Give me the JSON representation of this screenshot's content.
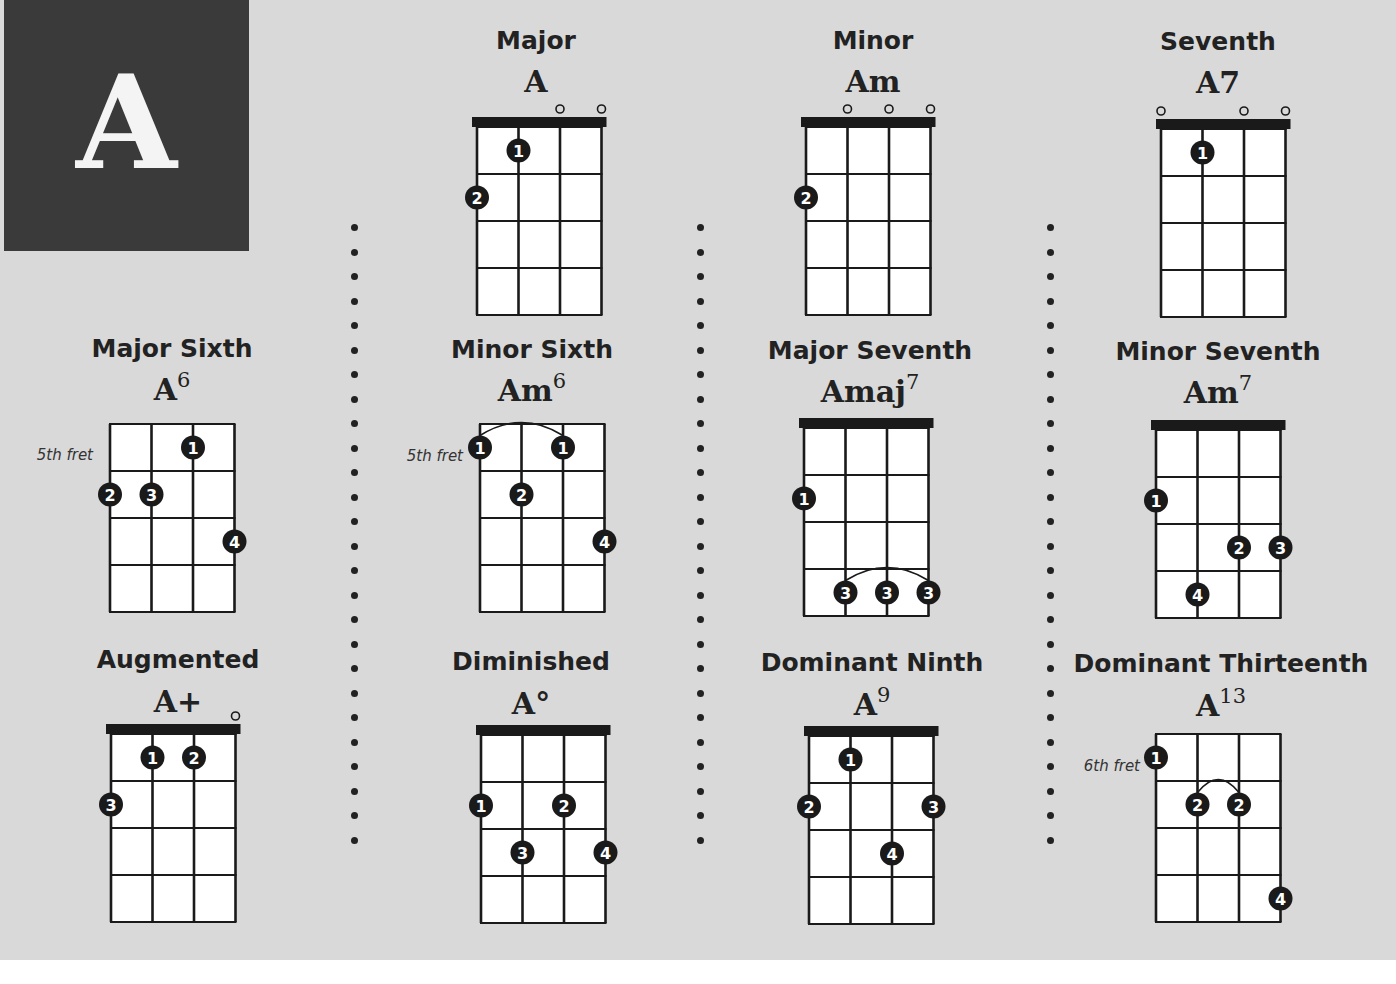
{
  "page": {
    "key_letter": "A",
    "colors": {
      "background": "#d9d9d9",
      "letter_box": "#3a3a3a",
      "ink": "#1a1a1a",
      "grid_fill": "#ffffff"
    }
  },
  "chords": [
    {
      "id": "major",
      "title": "Major",
      "symbol": "A",
      "sup": "",
      "fret_label": "",
      "nut": true,
      "open": [
        2,
        3
      ],
      "fingers": [
        {
          "string": 1,
          "fret": 1,
          "finger": "1"
        },
        {
          "string": 0,
          "fret": 2,
          "finger": "2"
        }
      ],
      "barre": null
    },
    {
      "id": "minor",
      "title": "Minor",
      "symbol": "Am",
      "sup": "",
      "fret_label": "",
      "nut": true,
      "open": [
        1,
        2,
        3
      ],
      "fingers": [
        {
          "string": 0,
          "fret": 2,
          "finger": "2"
        }
      ],
      "barre": null
    },
    {
      "id": "seventh",
      "title": "Seventh",
      "symbol": "A7",
      "sup": "",
      "fret_label": "",
      "nut": true,
      "open": [
        0,
        2,
        3
      ],
      "fingers": [
        {
          "string": 1,
          "fret": 1,
          "finger": "1"
        }
      ],
      "barre": null
    },
    {
      "id": "major-sixth",
      "title": "Major Sixth",
      "symbol": "A",
      "sup": "6",
      "fret_label": "5th fret",
      "nut": false,
      "open": [],
      "fingers": [
        {
          "string": 2,
          "fret": 1,
          "finger": "1"
        },
        {
          "string": 0,
          "fret": 2,
          "finger": "2"
        },
        {
          "string": 1,
          "fret": 2,
          "finger": "3"
        },
        {
          "string": 3,
          "fret": 3,
          "finger": "4"
        }
      ],
      "barre": null
    },
    {
      "id": "minor-sixth",
      "title": "Minor Sixth",
      "symbol": "Am",
      "sup": "6",
      "fret_label": "5th fret",
      "nut": false,
      "open": [],
      "fingers": [
        {
          "string": 0,
          "fret": 1,
          "finger": "1"
        },
        {
          "string": 2,
          "fret": 1,
          "finger": "1"
        },
        {
          "string": 1,
          "fret": 2,
          "finger": "2"
        },
        {
          "string": 3,
          "fret": 3,
          "finger": "4"
        }
      ],
      "barre": {
        "fret": 1,
        "from": 0,
        "to": 2
      }
    },
    {
      "id": "major-seventh",
      "title": "Major Seventh",
      "symbol": "Amaj",
      "sup": "7",
      "fret_label": "",
      "nut": true,
      "open": [],
      "fingers": [
        {
          "string": 0,
          "fret": 2,
          "finger": "1"
        },
        {
          "string": 1,
          "fret": 4,
          "finger": "3"
        },
        {
          "string": 2,
          "fret": 4,
          "finger": "3"
        },
        {
          "string": 3,
          "fret": 4,
          "finger": "3"
        }
      ],
      "barre": {
        "fret": 4,
        "from": 1,
        "to": 3
      }
    },
    {
      "id": "minor-seventh",
      "title": "Minor Seventh",
      "symbol": "Am",
      "sup": "7",
      "fret_label": "",
      "nut": true,
      "open": [],
      "fingers": [
        {
          "string": 0,
          "fret": 2,
          "finger": "1"
        },
        {
          "string": 2,
          "fret": 3,
          "finger": "2"
        },
        {
          "string": 3,
          "fret": 3,
          "finger": "3"
        },
        {
          "string": 1,
          "fret": 4,
          "finger": "4"
        }
      ],
      "barre": null
    },
    {
      "id": "augmented",
      "title": "Augmented",
      "symbol": "A+",
      "sup": "",
      "fret_label": "",
      "nut": true,
      "open": [
        3
      ],
      "fingers": [
        {
          "string": 1,
          "fret": 1,
          "finger": "1"
        },
        {
          "string": 2,
          "fret": 1,
          "finger": "2"
        },
        {
          "string": 0,
          "fret": 2,
          "finger": "3"
        }
      ],
      "barre": null
    },
    {
      "id": "diminished",
      "title": "Diminished",
      "symbol": "A°",
      "sup": "",
      "fret_label": "",
      "nut": true,
      "open": [],
      "fingers": [
        {
          "string": 0,
          "fret": 2,
          "finger": "1"
        },
        {
          "string": 2,
          "fret": 2,
          "finger": "2"
        },
        {
          "string": 1,
          "fret": 3,
          "finger": "3"
        },
        {
          "string": 3,
          "fret": 3,
          "finger": "4"
        }
      ],
      "barre": null
    },
    {
      "id": "dominant-ninth",
      "title": "Dominant Ninth",
      "symbol": "A",
      "sup": "9",
      "fret_label": "",
      "nut": true,
      "open": [],
      "fingers": [
        {
          "string": 1,
          "fret": 1,
          "finger": "1"
        },
        {
          "string": 0,
          "fret": 2,
          "finger": "2"
        },
        {
          "string": 3,
          "fret": 2,
          "finger": "3"
        },
        {
          "string": 2,
          "fret": 3,
          "finger": "4"
        }
      ],
      "barre": null
    },
    {
      "id": "dominant-thirteenth",
      "title": "Dominant Thirteenth",
      "symbol": "A",
      "sup": "13",
      "fret_label": "6th fret",
      "nut": false,
      "open": [],
      "fingers": [
        {
          "string": 0,
          "fret": 1,
          "finger": "1"
        },
        {
          "string": 1,
          "fret": 2,
          "finger": "2"
        },
        {
          "string": 2,
          "fret": 2,
          "finger": "2"
        },
        {
          "string": 3,
          "fret": 4,
          "finger": "4"
        }
      ],
      "barre": {
        "fret": 2,
        "from": 1,
        "to": 2
      }
    }
  ]
}
